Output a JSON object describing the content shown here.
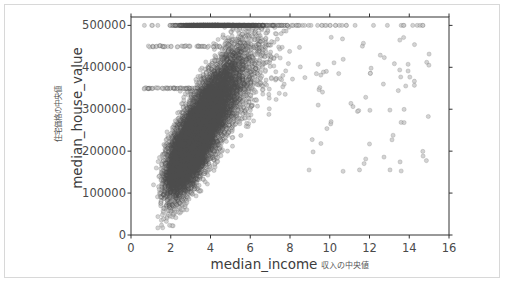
{
  "figure": {
    "background_color": "#ffffff",
    "frame_color": "#d8d8d8",
    "axes_color": "#333333"
  },
  "axis_labels": {
    "x_latin": "median_income",
    "x_japanese": "収入の中央値",
    "y_latin": "median_house_value",
    "y_japanese": "住宅価格の中央値"
  },
  "chart_data": {
    "type": "scatter",
    "title": "",
    "xlabel": "median_income 収入の中央値",
    "ylabel": "median_house_value 住宅価格の中央値",
    "xlim": [
      0,
      16
    ],
    "ylim": [
      0,
      520000
    ],
    "grid": false,
    "legend": null,
    "marker": {
      "shape": "circle",
      "face_color": "#808080",
      "edge_color": "#4d4d4d",
      "alpha": 0.35,
      "size_px": 4.2
    },
    "xticks": [
      0,
      2,
      4,
      6,
      8,
      10,
      12,
      14,
      16
    ],
    "xtick_labels": [
      "0",
      "2",
      "4",
      "6",
      "8",
      "10",
      "12",
      "14",
      "16"
    ],
    "yticks": [
      0,
      100000,
      200000,
      300000,
      400000,
      500000
    ],
    "ytick_labels": [
      "0",
      "100000",
      "200000",
      "300000",
      "400000",
      "500000"
    ],
    "n_points": 20640,
    "annotations": [
      "Dense horizontal band of capped values at y = 500000 spanning x ≈ 0.5 to 15.0",
      "Secondary faint horizontal band near y = 350000 for x ≈ 0.5 to 5",
      "Main cloud concentrated between x = 1.5 and 6.5, y = 80000 to 350000",
      "Positive correlation: house value rises with income",
      "Sparse outlying points for x > 9"
    ],
    "x": [
      0.53,
      0.75,
      0.88,
      0.96,
      1.02,
      1.09,
      1.13,
      1.18,
      1.22,
      1.27,
      1.31,
      1.35,
      1.39,
      1.42,
      1.46,
      1.5,
      1.53,
      1.57,
      1.6,
      1.64,
      1.67,
      1.7,
      1.74,
      1.77,
      1.8,
      1.84,
      1.87,
      1.9,
      1.93,
      1.96,
      2.0,
      2.03,
      2.06,
      2.09,
      2.12,
      2.15,
      2.18,
      2.21,
      2.24,
      2.27,
      2.3,
      2.33,
      2.36,
      2.39,
      2.42,
      2.45,
      2.48,
      2.51,
      2.54,
      2.57,
      2.6,
      2.63,
      2.66,
      2.69,
      2.72,
      2.75,
      2.78,
      2.81,
      2.84,
      2.87,
      2.9,
      2.93,
      2.96,
      2.99,
      3.02,
      3.05,
      3.08,
      3.11,
      3.14,
      3.17,
      3.2,
      3.23,
      3.26,
      3.29,
      3.32,
      3.35,
      3.38,
      3.41,
      3.44,
      3.47,
      3.5,
      3.53,
      3.56,
      3.6,
      3.63,
      3.66,
      3.7,
      3.73,
      3.77,
      3.8,
      3.84,
      3.88,
      3.91,
      3.95,
      3.99,
      4.03,
      4.07,
      4.11,
      4.15,
      4.19,
      4.23,
      4.27,
      4.31,
      4.36,
      4.4,
      4.45,
      4.5,
      4.54,
      4.59,
      4.64,
      4.69,
      4.74,
      4.8,
      4.85,
      4.91,
      4.97,
      5.03,
      5.09,
      5.15,
      5.22,
      5.29,
      5.36,
      5.43,
      5.51,
      5.59,
      5.67,
      5.76,
      5.85,
      5.95,
      6.05,
      6.16,
      6.27,
      6.39,
      6.52,
      6.66,
      6.81,
      6.97,
      7.14,
      7.33,
      7.54,
      7.77,
      8.03,
      8.32,
      8.65,
      9.03,
      9.47,
      10.0,
      10.64,
      11.45,
      12.5,
      13.9,
      15.0
    ],
    "y_median_trend": [
      52000,
      58000,
      64000,
      69000,
      74000,
      79000,
      84000,
      88000,
      92000,
      96000,
      100000,
      103000,
      106000,
      109000,
      112000,
      115000,
      117000,
      120000,
      122000,
      125000,
      127000,
      129000,
      132000,
      134000,
      136000,
      138000,
      140000,
      142000,
      144000,
      146000,
      148000,
      150000,
      152000,
      154000,
      156000,
      158000,
      160000,
      162000,
      164000,
      166000,
      168000,
      170000,
      172000,
      174000,
      176000,
      178000,
      180000,
      182000,
      184000,
      186000,
      188000,
      190000,
      192000,
      194000,
      196000,
      198000,
      200000,
      202000,
      204000,
      206000,
      208000,
      210000,
      212000,
      214000,
      216000,
      218000,
      220000,
      222000,
      224000,
      226000,
      228000,
      230000,
      232000,
      234000,
      236000,
      238000,
      241000,
      243000,
      245000,
      247000,
      250000,
      252000,
      254000,
      257000,
      259000,
      262000,
      264000,
      267000,
      269000,
      272000,
      275000,
      277000,
      280000,
      283000,
      286000,
      289000,
      292000,
      295000,
      298000,
      301000,
      304000,
      307000,
      310000,
      313000,
      316000,
      320000,
      323000,
      326000,
      330000,
      333000,
      337000,
      340000,
      344000,
      348000,
      351000,
      355000,
      359000,
      363000,
      367000,
      371000,
      375000,
      379000,
      383000,
      387000,
      391000,
      395000,
      400000,
      404000,
      408000,
      412000,
      416000,
      420000,
      425000,
      429000,
      433000,
      437000,
      441000,
      445000,
      449000,
      452000,
      456000,
      459000,
      462000,
      465000,
      468000,
      471000,
      474000,
      477000,
      480000,
      482000,
      485000,
      487000,
      489000,
      491000
    ],
    "capped_value": 500000,
    "cap_note": "median_house_value is censored at 500001"
  }
}
